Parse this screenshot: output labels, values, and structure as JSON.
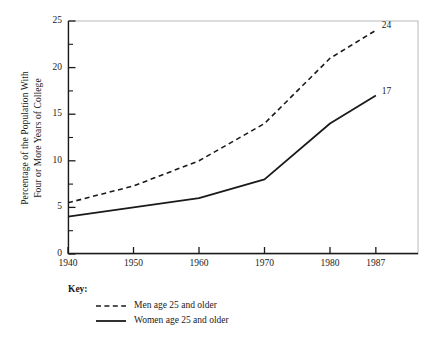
{
  "chart_data": {
    "type": "line",
    "title": "",
    "xlabel": "",
    "ylabel_line1": "Percentage of the Population With",
    "ylabel_line2": "Four or More Years of College",
    "x": [
      1940,
      1950,
      1960,
      1970,
      1980,
      1987
    ],
    "categories": [
      "1940",
      "1950",
      "1960",
      "1970",
      "1980",
      "1987"
    ],
    "xtick_labels": [
      "1940",
      "1950",
      "1960",
      "1970",
      "1980",
      "1987"
    ],
    "ytick_labels": [
      "0",
      "5",
      "10",
      "15",
      "20",
      "25"
    ],
    "ytick_values": [
      0,
      5,
      10,
      15,
      20,
      25
    ],
    "yminor_values": [
      2.5,
      7.5,
      12.5,
      17.5,
      22.5
    ],
    "xlim": [
      1940,
      1987
    ],
    "ylim": [
      0,
      25
    ],
    "grid": false,
    "legend_position": "below-axes-left",
    "series": [
      {
        "name": "Men age 25 and older",
        "style": "dashed",
        "color": "#1a1a1a",
        "values": [
          5.5,
          7.3,
          10.0,
          14.0,
          21.0,
          24.0
        ],
        "end_label": "24"
      },
      {
        "name": "Women age 25 and older",
        "style": "solid",
        "color": "#1a1a1a",
        "values": [
          4.0,
          5.0,
          6.0,
          8.0,
          14.0,
          17.0
        ],
        "end_label": "17"
      }
    ],
    "annotations": [
      {
        "text": "24",
        "x": 1987,
        "y": 24.0
      },
      {
        "text": "17",
        "x": 1987,
        "y": 17.0
      }
    ]
  },
  "key": {
    "title": "Key:",
    "items": [
      {
        "label": "Men age 25 and older",
        "style": "dashed"
      },
      {
        "label": "Women age 25 and older",
        "style": "solid"
      }
    ]
  }
}
